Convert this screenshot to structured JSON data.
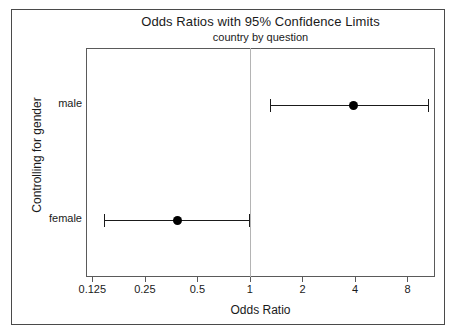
{
  "chart_data": {
    "type": "scatter",
    "title": "Odds Ratios with 95% Confidence Limits",
    "subtitle": "country by question",
    "xlabel": "Odds Ratio",
    "ylabel": "Controlling for gender",
    "xscale": "log2",
    "xlim": [
      0.115,
      11.5
    ],
    "xticks": [
      0.125,
      0.25,
      0.5,
      1,
      2,
      4,
      8
    ],
    "xticklabels": [
      "0.125",
      "0.25",
      "0.5",
      "1",
      "2",
      "4",
      "8"
    ],
    "categories": [
      "male",
      "female"
    ],
    "reference_line": 1,
    "grid": false,
    "legend": "none",
    "marker": "filled-circle",
    "series": [
      {
        "name": "odds ratio",
        "points": [
          {
            "category": "male",
            "estimate": 3.9,
            "ci_low": 1.3,
            "ci_high": 10.5
          },
          {
            "category": "female",
            "estimate": 0.38,
            "ci_low": 0.145,
            "ci_high": 0.99
          }
        ]
      }
    ],
    "colors": {
      "marker": "#000000",
      "error_bar": "#1a1a1a",
      "reference_line": "#b4b4b4",
      "frame": "#5a5a5a",
      "background": "#ffffff",
      "text": "#1a1a1a"
    }
  }
}
